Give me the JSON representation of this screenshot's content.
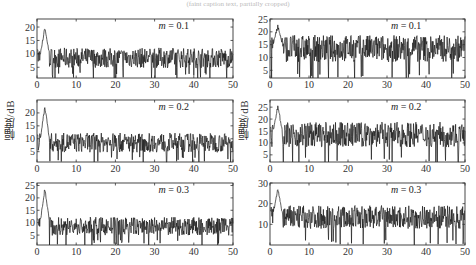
{
  "figure": {
    "caption_top": "(faint caption text, partially cropped)",
    "ylabel": "幅度/dB",
    "line_color": "#1a1a1a",
    "axis_color": "#333333"
  },
  "chart_data": [
    {
      "type": "line",
      "panel": "left-top",
      "annotation": "m = 0.1",
      "xlim": [
        0,
        50
      ],
      "ylim": [
        1,
        23
      ],
      "xticks": [
        0,
        10,
        20,
        30,
        40,
        50
      ],
      "yticks": [
        5,
        10,
        15,
        20
      ],
      "peak": {
        "x": 2,
        "y": 20.5
      },
      "baseline_mean": 8.5,
      "noise_range": [
        3,
        13
      ],
      "xlabel": "",
      "ylabel": ""
    },
    {
      "type": "line",
      "panel": "right-top",
      "annotation": "m = 0.1",
      "xlim": [
        0,
        50
      ],
      "ylim": [
        2,
        25
      ],
      "xticks": [
        0,
        10,
        20,
        30,
        40,
        50
      ],
      "yticks": [
        5,
        10,
        15,
        20,
        25
      ],
      "peak": {
        "x": 2,
        "y": 23
      },
      "baseline_mean": 13.5,
      "noise_range": [
        4,
        18
      ],
      "xlabel": "",
      "ylabel": ""
    },
    {
      "type": "line",
      "panel": "left-middle",
      "annotation": "m = 0.2",
      "xlim": [
        0,
        50
      ],
      "ylim": [
        1,
        25
      ],
      "xticks": [
        0,
        10,
        20,
        30,
        40,
        50
      ],
      "yticks": [
        5,
        10,
        15,
        20
      ],
      "peak": {
        "x": 2,
        "y": 23
      },
      "baseline_mean": 8.5,
      "noise_range": [
        3,
        13
      ],
      "xlabel": "",
      "ylabel": "幅度/dB"
    },
    {
      "type": "line",
      "panel": "right-middle",
      "annotation": "m = 0.2",
      "xlim": [
        0,
        50
      ],
      "ylim": [
        2,
        28
      ],
      "xticks": [
        0,
        10,
        20,
        30,
        40,
        50
      ],
      "yticks": [
        5,
        10,
        15,
        20,
        25
      ],
      "peak": {
        "x": 2,
        "y": 26
      },
      "baseline_mean": 13.5,
      "noise_range": [
        4,
        18
      ],
      "xlabel": "",
      "ylabel": "幅度/dB"
    },
    {
      "type": "line",
      "panel": "left-bottom",
      "annotation": "m = 0.3",
      "xlim": [
        0,
        50
      ],
      "ylim": [
        1,
        26
      ],
      "xticks": [
        0,
        10,
        20,
        30,
        40,
        50
      ],
      "yticks": [
        5,
        10,
        15,
        20,
        25
      ],
      "peak": {
        "x": 2,
        "y": 24.5
      },
      "baseline_mean": 8.5,
      "noise_range": [
        3,
        13
      ],
      "xlabel": "",
      "ylabel": ""
    },
    {
      "type": "line",
      "panel": "right-bottom",
      "annotation": "m = 0.3",
      "xlim": [
        0,
        50
      ],
      "ylim": [
        0,
        30
      ],
      "xticks": [
        0,
        10,
        20,
        30,
        40,
        50
      ],
      "yticks": [
        10,
        20,
        30
      ],
      "peak": {
        "x": 2,
        "y": 28
      },
      "baseline_mean": 13.5,
      "noise_range": [
        3,
        18
      ],
      "xlabel": "",
      "ylabel": ""
    }
  ]
}
